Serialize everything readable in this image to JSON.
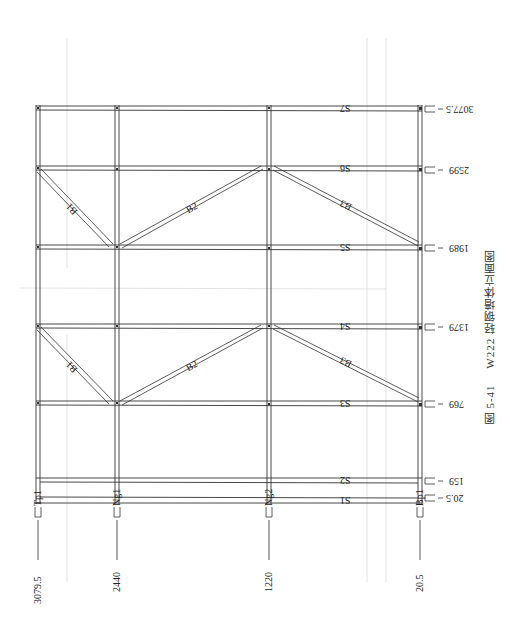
{
  "figure": {
    "caption_number": "图 5-41",
    "caption_title": "W222 轻钢墙体立面图"
  },
  "studs": [
    {
      "id": "Tp1",
      "label": "Tp1",
      "position": "3079.5",
      "x": 38
    },
    {
      "id": "Ng1",
      "label": "Ng1",
      "position": "2440",
      "x": 117
    },
    {
      "id": "Ng2",
      "label": "Ng2",
      "position": "1220",
      "x": 269
    },
    {
      "id": "Bp1",
      "label": "Bp1",
      "position": "20.5",
      "x": 420
    }
  ],
  "tracks": [
    {
      "id": "S7",
      "label": "S7",
      "elevation": "3077.5",
      "y": 109
    },
    {
      "id": "S6",
      "label": "S6",
      "elevation": "2599",
      "y": 169
    },
    {
      "id": "S5",
      "label": "S5",
      "elevation": "1989",
      "y": 248
    },
    {
      "id": "S4",
      "label": "S4",
      "elevation": "1379",
      "y": 327
    },
    {
      "id": "S3",
      "label": "S3",
      "elevation": "769",
      "y": 404
    },
    {
      "id": "S2",
      "label": "S2",
      "elevation": "159",
      "y": 480
    },
    {
      "id": "S1",
      "label": "S1",
      "elevation": "20.5",
      "y": 501
    }
  ],
  "braces": [
    {
      "label": "B1",
      "panel": "upper",
      "from": "Tp1@S6",
      "to": "Ng1@S5"
    },
    {
      "label": "B2",
      "panel": "upper",
      "from": "Ng1@S5",
      "to": "Ng2@S6"
    },
    {
      "label": "B3",
      "panel": "upper",
      "from": "Ng2@S6",
      "to": "Bp1@S5"
    },
    {
      "label": "B1",
      "panel": "lower",
      "from": "Tp1@S4",
      "to": "Ng1@S3"
    },
    {
      "label": "B2",
      "panel": "lower",
      "from": "Ng1@S3",
      "to": "Ng2@S4"
    },
    {
      "label": "B3",
      "panel": "lower",
      "from": "Ng2@S4",
      "to": "Bp1@S3"
    }
  ],
  "colors": {
    "line": "#333333",
    "guide": "#d8d8d8",
    "background": "#ffffff"
  }
}
